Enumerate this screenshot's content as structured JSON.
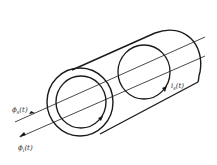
{
  "diagram": {
    "labels": {
      "flux_s": {
        "base": "ϕ",
        "sub": "s",
        "arg": "(t)"
      },
      "flux_i": {
        "base": "ϕ",
        "sub": "i",
        "arg": "(t)"
      },
      "current": {
        "base": "i",
        "sub": "s",
        "arg": "(t)"
      }
    },
    "colors": {
      "stroke": "#1a1a1a",
      "background": "#ffffff"
    }
  }
}
